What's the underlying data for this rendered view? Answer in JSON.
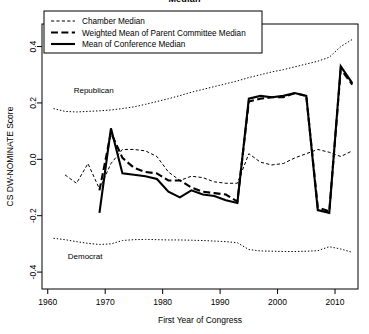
{
  "chart_data": {
    "type": "line",
    "title": "Median",
    "xlabel": "First Year of Congress",
    "ylabel": "CS DW-NOMINATE Score",
    "xlim": [
      1959,
      2014
    ],
    "ylim": [
      -0.46,
      0.48
    ],
    "xticks": [
      1960,
      1970,
      1980,
      1990,
      2000,
      2010
    ],
    "yticks": [
      -0.4,
      -0.2,
      0.0,
      0.2,
      0.4
    ],
    "ytick_labels": [
      "-0.4",
      "-0.2",
      "0.0",
      "0.2",
      "0.4"
    ],
    "xtick_labels": [
      "1960",
      "1970",
      "1980",
      "1990",
      "2000",
      "2010"
    ],
    "grid": false,
    "legend_position": "top-left",
    "annotations": [
      {
        "text": "Republican",
        "x": 1968.0,
        "y": 0.235
      },
      {
        "text": "Democrat",
        "x": 1966.5,
        "y": -0.355
      }
    ],
    "series": [
      {
        "name": "Chamber Median",
        "style": "dot-dash",
        "x": [
          1963,
          1965,
          1967,
          1969,
          1971,
          1973,
          1975,
          1977,
          1979,
          1981,
          1983,
          1985,
          1987,
          1989,
          1991,
          1993,
          1995,
          1997,
          1999,
          2001,
          2003,
          2005,
          2007,
          2009,
          2011,
          2013
        ],
        "values": [
          -0.055,
          -0.085,
          -0.015,
          -0.105,
          -0.015,
          0.035,
          0.035,
          0.03,
          0.01,
          -0.045,
          -0.075,
          -0.06,
          -0.065,
          -0.08,
          -0.085,
          -0.085,
          0.02,
          -0.01,
          -0.02,
          -0.015,
          0.005,
          0.02,
          0.035,
          0.025,
          0.01,
          0.03
        ]
      },
      {
        "name": "Weighted Mean of Parent Committee Median",
        "style": "dashed-thick",
        "x": [
          1969,
          1971,
          1973,
          1975,
          1977,
          1979,
          1981,
          1983,
          1985,
          1987,
          1989,
          1991,
          1993,
          1995,
          1997,
          1999,
          2001,
          2003,
          2005,
          2007,
          2009,
          2011,
          2013
        ],
        "values": [
          -0.11,
          0.095,
          0.005,
          -0.03,
          -0.045,
          -0.05,
          -0.075,
          -0.075,
          -0.1,
          -0.115,
          -0.12,
          -0.125,
          -0.15,
          0.205,
          0.215,
          0.22,
          0.22,
          0.235,
          0.225,
          -0.17,
          -0.185,
          0.32,
          0.265
        ]
      },
      {
        "name": "Mean of Conference Median",
        "style": "solid-thick",
        "x": [
          1969,
          1971,
          1973,
          1975,
          1977,
          1979,
          1981,
          1983,
          1985,
          1987,
          1989,
          1991,
          1993,
          1995,
          1997,
          1999,
          2001,
          2003,
          2005,
          2007,
          2009,
          2011,
          2013
        ],
        "values": [
          -0.19,
          0.11,
          -0.05,
          -0.055,
          -0.06,
          -0.07,
          -0.115,
          -0.135,
          -0.11,
          -0.125,
          -0.13,
          -0.145,
          -0.155,
          0.215,
          0.225,
          0.22,
          0.225,
          0.235,
          0.225,
          -0.18,
          -0.19,
          0.33,
          0.27
        ]
      },
      {
        "name": "Republican",
        "style": "dotted",
        "x": [
          1961,
          1963,
          1965,
          1967,
          1969,
          1971,
          1973,
          1975,
          1977,
          1979,
          1981,
          1983,
          1985,
          1987,
          1989,
          1991,
          1993,
          1995,
          1997,
          1999,
          2001,
          2003,
          2005,
          2007,
          2009,
          2011,
          2013
        ],
        "values": [
          0.18,
          0.17,
          0.168,
          0.17,
          0.172,
          0.175,
          0.18,
          0.186,
          0.195,
          0.205,
          0.215,
          0.226,
          0.238,
          0.248,
          0.258,
          0.268,
          0.278,
          0.29,
          0.3,
          0.31,
          0.318,
          0.328,
          0.338,
          0.348,
          0.362,
          0.4,
          0.425
        ]
      },
      {
        "name": "Democrat",
        "style": "dotted",
        "x": [
          1961,
          1963,
          1965,
          1967,
          1969,
          1971,
          1973,
          1975,
          1977,
          1979,
          1981,
          1983,
          1985,
          1987,
          1989,
          1991,
          1993,
          1995,
          1997,
          1999,
          2001,
          2003,
          2005,
          2007,
          2009,
          2011,
          2013
        ],
        "values": [
          -0.28,
          -0.285,
          -0.292,
          -0.298,
          -0.302,
          -0.3,
          -0.288,
          -0.285,
          -0.284,
          -0.285,
          -0.286,
          -0.286,
          -0.287,
          -0.288,
          -0.29,
          -0.292,
          -0.296,
          -0.32,
          -0.325,
          -0.326,
          -0.327,
          -0.327,
          -0.326,
          -0.324,
          -0.31,
          -0.318,
          -0.33
        ]
      }
    ]
  },
  "legend": {
    "items": [
      {
        "label": "Chamber Median",
        "style": "dot-dash"
      },
      {
        "label": "Weighted Mean of Parent Committee Median",
        "style": "dashed-thick"
      },
      {
        "label": "Mean of Conference Median",
        "style": "solid-thick"
      }
    ]
  }
}
